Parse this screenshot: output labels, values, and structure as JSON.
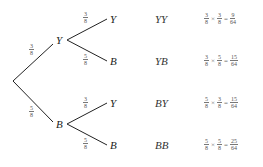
{
  "diagram": {
    "type": "probability-tree",
    "line_color": "#222222",
    "root": {
      "x": 13,
      "y": 81
    },
    "level1": [
      {
        "label": "Y",
        "prob_num": "3",
        "prob_den": "8",
        "x": 53,
        "y": 41
      },
      {
        "label": "B",
        "prob_num": "5",
        "prob_den": "8",
        "x": 53,
        "y": 122
      }
    ],
    "level2": [
      {
        "parent": "Y",
        "label": "Y",
        "prob_num": "3",
        "prob_den": "8",
        "x": 107,
        "y": 19
      },
      {
        "parent": "Y",
        "label": "B",
        "prob_num": "5",
        "prob_den": "8",
        "x": 107,
        "y": 61
      },
      {
        "parent": "B",
        "label": "Y",
        "prob_num": "3",
        "prob_den": "8",
        "x": 107,
        "y": 103
      },
      {
        "parent": "B",
        "label": "B",
        "prob_num": "5",
        "prob_den": "8",
        "x": 107,
        "y": 145
      }
    ],
    "outcomes": [
      {
        "label": "YY",
        "a_num": "3",
        "a_den": "8",
        "b_num": "3",
        "b_den": "8",
        "times": "×",
        "equals": "=",
        "r_num": "9",
        "r_den": "64"
      },
      {
        "label": "YB",
        "a_num": "3",
        "a_den": "8",
        "b_num": "5",
        "b_den": "8",
        "times": "×",
        "equals": "=",
        "r_num": "15",
        "r_den": "64"
      },
      {
        "label": "BY",
        "a_num": "5",
        "a_den": "8",
        "b_num": "3",
        "b_den": "8",
        "times": "×",
        "equals": "=",
        "r_num": "15",
        "r_den": "64"
      },
      {
        "label": "BB",
        "a_num": "5",
        "a_den": "8",
        "b_num": "5",
        "b_den": "8",
        "times": "×",
        "equals": "=",
        "r_num": "25",
        "r_den": "64"
      }
    ]
  }
}
